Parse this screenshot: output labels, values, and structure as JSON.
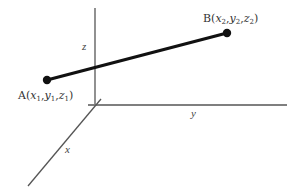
{
  "diagram": {
    "type": "3d-coordinate-line-segment",
    "axes": {
      "x": {
        "label": "x"
      },
      "y": {
        "label": "y"
      },
      "z": {
        "label": "z"
      }
    },
    "points": [
      {
        "name": "A",
        "coords": [
          "x",
          "y",
          "z"
        ],
        "subscript": "1",
        "label_prefix": "A(",
        "label_suffix": ")"
      },
      {
        "name": "B",
        "coords": [
          "x",
          "y",
          "z"
        ],
        "subscript": "2",
        "label_prefix": "B(",
        "label_suffix": ")"
      }
    ],
    "separator": ",",
    "colors": {
      "axis": "#555555",
      "segment": "#111111",
      "text": "#333333"
    }
  }
}
